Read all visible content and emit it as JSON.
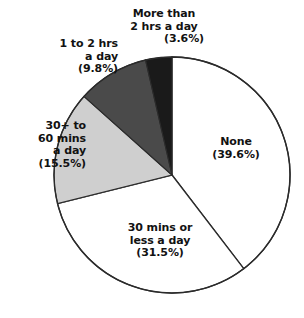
{
  "chart_data": {
    "type": "pie",
    "title": "",
    "subtitle": "",
    "xlabel": "",
    "ylabel": "",
    "legend_position": "none",
    "grid": false,
    "units": "percent",
    "start_angle_deg": 0,
    "direction": "clockwise",
    "categories": [
      "None",
      "30 mins or less a day",
      "30+ to 60 mins a day",
      "1 to 2 hrs a day",
      "More than 2 hrs a day"
    ],
    "values": [
      39.6,
      31.5,
      15.5,
      9.8,
      3.6
    ],
    "colors": [
      "#ffffff",
      "#ffffff",
      "#cfcfcf",
      "#4a4a4a",
      "#1a1a1a"
    ],
    "slices": [
      {
        "label": "None",
        "value": 39.6,
        "value_text": "(39.6%)",
        "color": "#ffffff",
        "start_deg": 0,
        "end_deg": 142.56
      },
      {
        "label": "30 mins or less a day",
        "value": 31.5,
        "value_text": "(31.5%)",
        "color": "#ffffff",
        "start_deg": 142.56,
        "end_deg": 255.96
      },
      {
        "label": "30+ to 60 mins a day",
        "value": 15.5,
        "value_text": "(15.5%)",
        "color": "#cfcfcf",
        "start_deg": 255.96,
        "end_deg": 311.76
      },
      {
        "label": "1 to 2 hrs a day",
        "value": 9.8,
        "value_text": "(9.8%)",
        "color": "#4a4a4a",
        "start_deg": 311.76,
        "end_deg": 347.04
      },
      {
        "label": "More than 2 hrs a day",
        "value": 3.6,
        "value_text": "(3.6%)",
        "color": "#1a1a1a",
        "start_deg": 347.04,
        "end_deg": 360
      }
    ]
  },
  "labels": {
    "more_than_2": {
      "line1": "More than",
      "line2": "2 hrs a day",
      "line3": "(3.6%)"
    },
    "one_to_two": {
      "line1": "1 to 2 hrs",
      "line2": "a day",
      "line3": "(9.8%)"
    },
    "thirty_to_sixty": {
      "line1": "30+ to",
      "line2": "60 mins",
      "line3": "a day",
      "line4": "(15.5%)"
    },
    "none": {
      "line1": "None",
      "line2": "(39.6%)"
    },
    "thirty_or_less": {
      "line1": "30 mins or",
      "line2": "less a day",
      "line3": "(31.5%)"
    }
  },
  "style": {
    "outline_color": "#2b2b2b",
    "background": "#ffffff",
    "text_color": "#121212"
  }
}
